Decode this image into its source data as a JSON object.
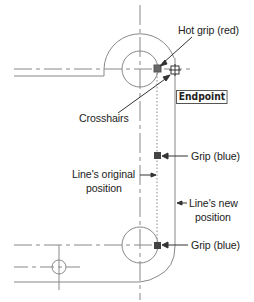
{
  "diagram": {
    "callouts": {
      "hot_grip": "Hot grip (red)",
      "crosshairs": "Crosshairs",
      "tooltip": "Endpoint",
      "grip_upper": "Grip (blue)",
      "original_line_1": "Line's original",
      "original_line_2": "position",
      "new_line_1": "Line's new",
      "new_line_2": "position",
      "grip_lower": "Grip (blue)"
    },
    "colors": {
      "line": "#777777",
      "grip_hot": "#666666",
      "grip": "#444444",
      "text": "#222222",
      "background": "#ffffff"
    }
  }
}
